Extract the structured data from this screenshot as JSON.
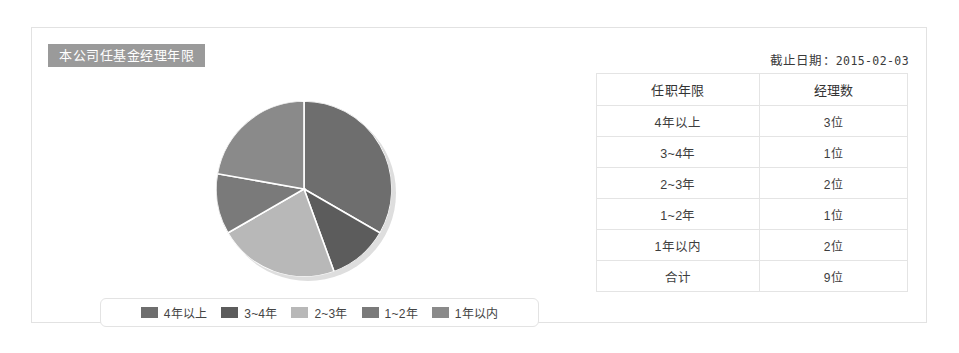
{
  "card": {
    "title": "本公司任基金经理年限",
    "cutoff_label": "截止日期：",
    "cutoff_date": "2015-02-03"
  },
  "chart_data": {
    "type": "pie",
    "title": "本公司任基金经理年限",
    "categories": [
      "4年以上",
      "3~4年",
      "2~3年",
      "1~2年",
      "1年以内"
    ],
    "values": [
      3,
      1,
      2,
      1,
      2
    ],
    "unit": "位",
    "total": 9,
    "colors": [
      "#6e6e6e",
      "#5c5c5c",
      "#b8b8b8",
      "#7a7a7a",
      "#8a8a8a"
    ],
    "slice_percent": [
      "33.3",
      "11.1",
      "22.2",
      "11.1",
      "22.2"
    ],
    "start_angle": 0,
    "direction": "clockwise",
    "legend_position": "bottom",
    "grid": false,
    "xlabel": "",
    "ylabel": ""
  },
  "legend": {
    "items": [
      {
        "label": "4年以上",
        "color": "#6e6e6e"
      },
      {
        "label": "3~4年",
        "color": "#5c5c5c"
      },
      {
        "label": "2~3年",
        "color": "#b8b8b8"
      },
      {
        "label": "1~2年",
        "color": "#7a7a7a"
      },
      {
        "label": "1年以内",
        "color": "#8a8a8a"
      }
    ]
  },
  "table": {
    "headers": [
      "任职年限",
      "经理数"
    ],
    "rows": [
      {
        "tenure": "4年以上",
        "count": "3位"
      },
      {
        "tenure": "3~4年",
        "count": "1位"
      },
      {
        "tenure": "2~3年",
        "count": "2位"
      },
      {
        "tenure": "1~2年",
        "count": "1位"
      },
      {
        "tenure": "1年以内",
        "count": "2位"
      },
      {
        "tenure": "合计",
        "count": "9位"
      }
    ]
  }
}
